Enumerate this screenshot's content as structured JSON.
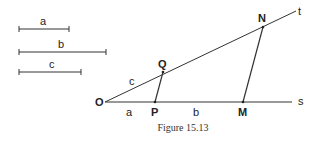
{
  "figure": {
    "caption": "Figure 15.13",
    "segments": [
      {
        "label": "a",
        "x1": 19,
        "x2": 69,
        "y": 29
      },
      {
        "label": "b",
        "x1": 19,
        "x2": 106,
        "y": 52
      },
      {
        "label": "c",
        "x1": 19,
        "x2": 81,
        "y": 72
      }
    ],
    "points": {
      "O": "O",
      "P": "P",
      "M": "M",
      "Q": "Q",
      "N": "N"
    },
    "rays": {
      "s": "s",
      "t": "t"
    },
    "ray_segment_labels": {
      "OP": "a",
      "PM": "b",
      "OQ": "c"
    }
  }
}
